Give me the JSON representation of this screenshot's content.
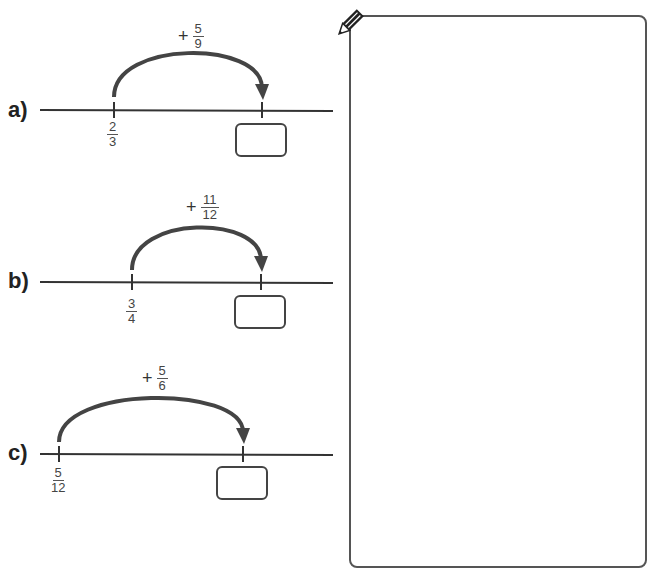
{
  "questions": [
    {
      "label": "a)",
      "start": {
        "num": "2",
        "den": "3"
      },
      "jump": {
        "sign": "+",
        "num": "5",
        "den": "9"
      },
      "answer": ""
    },
    {
      "label": "b)",
      "start": {
        "num": "3",
        "den": "4"
      },
      "jump": {
        "sign": "+",
        "num": "11",
        "den": "12"
      },
      "answer": ""
    },
    {
      "label": "c)",
      "start": {
        "num": "5",
        "den": "12"
      },
      "jump": {
        "sign": "+",
        "num": "5",
        "den": "6"
      },
      "answer": ""
    }
  ],
  "work_area": {
    "icon": "pencil-icon"
  }
}
